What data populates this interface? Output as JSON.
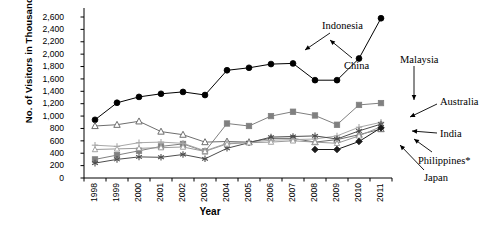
{
  "chart_data": {
    "type": "line",
    "title": "",
    "xlabel": "Year",
    "ylabel": "No. of Visitors in Thousands",
    "categories": [
      "1998",
      "1999",
      "2000",
      "2001",
      "2002",
      "2003",
      "2004",
      "2005",
      "2006",
      "2007",
      "2008",
      "2009",
      "2010",
      "2011"
    ],
    "ylim": [
      0,
      2600
    ],
    "ytick_values": [
      0,
      200,
      400,
      600,
      800,
      1000,
      1200,
      1400,
      1600,
      1800,
      2000,
      2200,
      2400,
      2600
    ],
    "ytick_labels": [
      "0",
      "200",
      "400",
      "600",
      "800",
      "1,000",
      "1,200",
      "1,400",
      "1,600",
      "1,800",
      "2,000",
      "2,200",
      "2,400",
      "2,600"
    ],
    "grid": false,
    "legend_position": "callout-arrows",
    "series": [
      {
        "name": "China",
        "marker": "filled-circle",
        "color": "#000000",
        "values": [
          940,
          1215,
          1310,
          1360,
          1390,
          1340,
          1740,
          1780,
          1840,
          1850,
          1580,
          1580,
          1930,
          2580
        ]
      },
      {
        "name": "Malaysia",
        "marker": "filled-square",
        "color": "#808080",
        "values": [
          300,
          370,
          440,
          510,
          550,
          430,
          880,
          840,
          1000,
          1070,
          1010,
          860,
          1180,
          1210
        ]
      },
      {
        "name": "Indonesia",
        "marker": "open-triangle",
        "color": "#6e6e6e",
        "values": [
          840,
          860,
          915,
          750,
          700,
          580,
          590,
          580,
          640,
          640,
          580,
          620,
          700,
          790
        ]
      },
      {
        "name": "Australia",
        "marker": "plus",
        "color": "#a8a8a8",
        "values": [
          530,
          510,
          570,
          580,
          560,
          440,
          560,
          580,
          610,
          620,
          630,
          680,
          820,
          900
        ]
      },
      {
        "name": "India",
        "marker": "asterisk",
        "color": "#4d4d4d",
        "values": [
          240,
          300,
          340,
          335,
          380,
          310,
          480,
          570,
          660,
          670,
          680,
          630,
          760,
          870
        ]
      },
      {
        "name": "Philippines*",
        "marker": "open-triangle-small",
        "color": "#9a9a9a",
        "values": [
          460,
          470,
          480,
          490,
          500,
          430,
          550,
          570,
          580,
          600,
          580,
          560,
          680,
          830
        ]
      },
      {
        "name": "Japan",
        "marker": "filled-diamond",
        "color": "#1a1a1a",
        "values": [
          null,
          null,
          null,
          null,
          null,
          null,
          null,
          null,
          null,
          null,
          460,
          460,
          590,
          810
        ]
      }
    ],
    "annotations": [
      {
        "label": "Indonesia",
        "target_series": "Indonesia"
      },
      {
        "label": "China",
        "target_series": "China"
      },
      {
        "label": "Malaysia",
        "target_series": "Malaysia"
      },
      {
        "label": "Australia",
        "target_series": "Australia"
      },
      {
        "label": "India",
        "target_series": "India"
      },
      {
        "label": "Philippines*",
        "target_series": "Philippines*"
      },
      {
        "label": "Japan",
        "target_series": "Japan"
      }
    ]
  }
}
